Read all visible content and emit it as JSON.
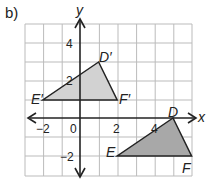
{
  "part_label": "b)",
  "axes": {
    "x_label": "x",
    "y_label": "y"
  },
  "ticks": {
    "x": [
      "−2",
      "0",
      "2",
      "4"
    ],
    "y": [
      "4",
      "2",
      "−2"
    ]
  },
  "triangles": {
    "image": {
      "D": "D′",
      "E": "E′",
      "F": "F′",
      "points": [
        [
          1,
          3
        ],
        [
          -2,
          1
        ],
        [
          2,
          1
        ]
      ],
      "fill": "#d2d2d2"
    },
    "original": {
      "D": "D",
      "E": "E",
      "F": "F",
      "points": [
        [
          5,
          0
        ],
        [
          2,
          -2
        ],
        [
          6,
          -2
        ]
      ],
      "fill": "#a8a8a8"
    }
  }
}
